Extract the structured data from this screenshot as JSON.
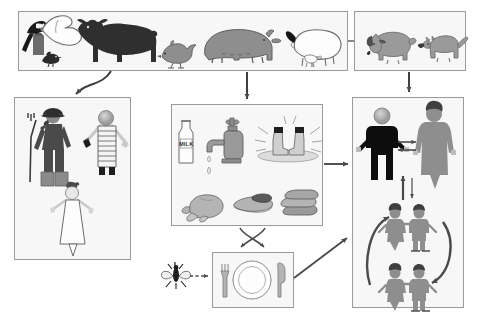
{
  "diagram": {
    "type": "flow-diagram",
    "background_color": "#ffffff",
    "box_fill": "#f7f7f7",
    "box_border": "#9a9a9a",
    "arrow_color": "#4a4a4a",
    "dark_figure": "#111111",
    "mid_gray": "#8e8e8e",
    "light_gray": "#c9c9c9"
  },
  "boxes": {
    "livestock": {
      "name": "Livestock / farm animals",
      "items": [
        {
          "label": "magpie",
          "icon": "magpie-icon"
        },
        {
          "label": "goose",
          "icon": "goose-icon"
        },
        {
          "label": "chick",
          "icon": "chick-icon"
        },
        {
          "label": "cow",
          "icon": "cow-icon"
        },
        {
          "label": "chicken",
          "icon": "chicken-icon"
        },
        {
          "label": "pig",
          "icon": "pig-icon"
        },
        {
          "label": "sheep",
          "icon": "sheep-icon"
        }
      ]
    },
    "pets": {
      "name": "Pets / companion animals",
      "items": [
        {
          "label": "dog",
          "icon": "dog-icon"
        },
        {
          "label": "cat",
          "icon": "cat-icon"
        }
      ]
    },
    "workers": {
      "name": "Farm and veterinary workers",
      "items": [
        {
          "label": "farmer with pitchfork",
          "icon": "farmer-icon"
        },
        {
          "label": "abattoir worker with apron and case",
          "icon": "worker-icon"
        },
        {
          "label": "laboratory worker in white coat",
          "icon": "lab-worker-icon"
        }
      ]
    },
    "food_water": {
      "name": "Food and water vehicles",
      "items": [
        {
          "label": "MILK",
          "icon": "milk-bottle-icon",
          "bottle_label": "MILK"
        },
        {
          "label": "tap water with drip",
          "icon": "water-tap-icon"
        },
        {
          "label": "boots in contaminated water",
          "icon": "boots-in-water-icon"
        },
        {
          "label": "poultry carcass",
          "icon": "poultry-icon"
        },
        {
          "label": "steak",
          "icon": "steak-icon"
        },
        {
          "label": "sausages",
          "icon": "sausages-icon"
        }
      ]
    },
    "table": {
      "name": "Prepared meal / place setting",
      "items": [
        {
          "label": "fork",
          "icon": "fork-icon"
        },
        {
          "label": "plate",
          "icon": "plate-icon"
        },
        {
          "label": "knife",
          "icon": "knife-icon"
        }
      ]
    },
    "fly": {
      "name": "Fly vector",
      "items": [
        {
          "label": "fly",
          "icon": "fly-icon"
        }
      ]
    },
    "humans": {
      "name": "Human population",
      "items": [
        {
          "label": "adult man",
          "icon": "man-icon"
        },
        {
          "label": "adult woman",
          "icon": "woman-icon"
        },
        {
          "label": "children pair upper",
          "icon": "children-pair-icon"
        },
        {
          "label": "children pair lower",
          "icon": "children-pair-icon"
        }
      ]
    }
  },
  "arrows": [
    {
      "name": "livestock-to-workers",
      "style": "curved-solid",
      "label": ""
    },
    {
      "name": "livestock-to-food",
      "style": "straight-solid",
      "label": ""
    },
    {
      "name": "pets-to-humans",
      "style": "straight-solid",
      "label": ""
    },
    {
      "name": "livestock-to-pets-link",
      "style": "connector",
      "label": ""
    },
    {
      "name": "food-to-humans",
      "style": "straight-solid",
      "label": ""
    },
    {
      "name": "food-table-crossed",
      "style": "crossed-double",
      "label": ""
    },
    {
      "name": "fly-to-table",
      "style": "dashed",
      "label": ""
    },
    {
      "name": "table-to-humans",
      "style": "diagonal-solid",
      "label": ""
    },
    {
      "name": "man-woman-exchange",
      "style": "double-horizontal",
      "label": ""
    },
    {
      "name": "adults-children-exchange",
      "style": "double-vertical",
      "label": ""
    },
    {
      "name": "children-cycle",
      "style": "curved-cycle",
      "label": ""
    }
  ]
}
